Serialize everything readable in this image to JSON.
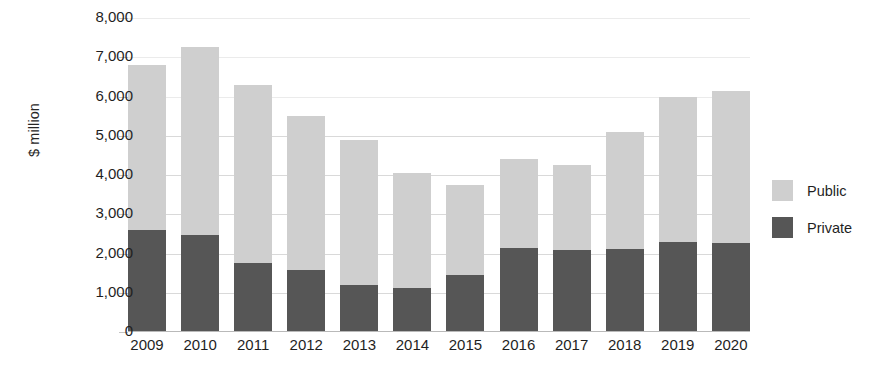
{
  "chart_data": {
    "type": "bar",
    "stacked": true,
    "title": "",
    "subtitle": "",
    "xlabel": "",
    "ylabel": "$ million",
    "ylim": [
      0,
      8000
    ],
    "ytick_step": 1000,
    "ytick_labels": [
      "8,000",
      "7,000",
      "6,000",
      "5,000",
      "4,000",
      "3,000",
      "2,000",
      "1,000",
      "0"
    ],
    "ytick_values": [
      8000,
      7000,
      6000,
      5000,
      4000,
      3000,
      2000,
      1000,
      0
    ],
    "grid": true,
    "grid_axis": "y",
    "legend_position": "right",
    "categories": [
      "2009",
      "2010",
      "2011",
      "2012",
      "2013",
      "2014",
      "2015",
      "2016",
      "2017",
      "2018",
      "2019",
      "2020"
    ],
    "series": [
      {
        "name": "Private",
        "color": "#565656",
        "values": [
          2600,
          2470,
          1750,
          1580,
          1200,
          1120,
          1450,
          2150,
          2080,
          2120,
          2290,
          2270
        ]
      },
      {
        "name": "Public",
        "color": "#cfcfcf",
        "values": [
          4200,
          4780,
          4550,
          3920,
          3700,
          2930,
          2300,
          2250,
          2170,
          2980,
          3710,
          3880
        ]
      }
    ],
    "totals": [
      6800,
      7250,
      6300,
      5500,
      4900,
      4050,
      3750,
      4400,
      4250,
      5100,
      6000,
      6150
    ]
  },
  "legend": {
    "items": [
      {
        "label": "Public",
        "color": "#cfcfcf"
      },
      {
        "label": "Private",
        "color": "#565656"
      }
    ]
  },
  "colors": {
    "public": "#cfcfcf",
    "private": "#565656",
    "grid": "#d2d2d2",
    "text": "#1f1f1f",
    "background": "#ffffff"
  }
}
